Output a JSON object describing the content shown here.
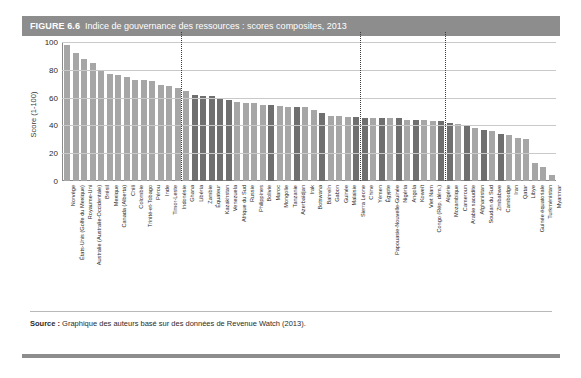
{
  "figure": {
    "number": "FIGURE 6.6",
    "title": "Indice de gouvernance des ressources : scores composites, 2013"
  },
  "source": {
    "label": "Source :",
    "text": "Graphique des auteurs basé sur des données de Revenue Watch (2013)."
  },
  "colors": {
    "header_band": "#8d8d8d",
    "bar_light": "#a6a6a6",
    "bar_dark": "#6f6f6f",
    "gridline": "#c9c9c9",
    "divider": "#3c3c3c"
  },
  "chart_data": {
    "type": "bar",
    "title": "Indice de gouvernance des ressources : scores composites, 2013",
    "xlabel": "",
    "ylabel": "Score (1-100)",
    "ylim": [
      0,
      100
    ],
    "yticks": [
      0,
      20,
      40,
      60,
      80,
      100
    ],
    "grid": true,
    "legend": "none",
    "dividers_after_index": [
      13,
      34,
      44
    ],
    "categories": [
      "Norvège",
      "États-Unis (Golfe du Mexique)",
      "Royaume-Uni",
      "Australie (Australie-Occidentale)",
      "Brésil",
      "Mexique",
      "Canada (Alberta)",
      "Chili",
      "Colombie",
      "Trinité-et-Tobago",
      "Pérou",
      "Inde",
      "Timor-Leste",
      "Indonésie",
      "Ghana",
      "Libéria",
      "Zambie",
      "Équateur",
      "Kazakhstan",
      "Venezuela",
      "Afrique du Sud",
      "Russie",
      "Philippines",
      "Bolivie",
      "Maroc",
      "Mongolie",
      "Tanzanie",
      "Azerbaïdjan",
      "Irak",
      "Botswana",
      "Bahreïn",
      "Gabon",
      "Guinée",
      "Malaisie",
      "Sierra Leone",
      "Chine",
      "Yémen",
      "Égypte",
      "Papouasie-Nouvelle-Guinée",
      "Nigéria",
      "Angola",
      "Koweït",
      "Viet Nam",
      "Congo (Rép. dém.)",
      "Algérie",
      "Mozambique",
      "Cameroun",
      "Arabie saoudite",
      "Afghanistan",
      "Soudan du Sud",
      "Zimbabwe",
      "Cambodge",
      "Iran",
      "Qatar",
      "Libye",
      "Guinée équatoriale",
      "Turkménistan",
      "Myanmar"
    ],
    "values": [
      98,
      92,
      88,
      85,
      80,
      77,
      76,
      75,
      73,
      73,
      72,
      69,
      68,
      67,
      65,
      62,
      61,
      61,
      60,
      58,
      57,
      56,
      56,
      55,
      55,
      54,
      53,
      53,
      53,
      51,
      49,
      47,
      47,
      46,
      46,
      45,
      45,
      45,
      45,
      45,
      44,
      44,
      44,
      43,
      43,
      42,
      41,
      40,
      38,
      37,
      36,
      34,
      33,
      31,
      30,
      13,
      10,
      4
    ],
    "bar_tones": [
      "light",
      "light",
      "light",
      "light",
      "light",
      "light",
      "light",
      "light",
      "light",
      "light",
      "light",
      "light",
      "light",
      "light",
      "light",
      "dark",
      "dark",
      "dark",
      "dark",
      "dark",
      "light",
      "light",
      "light",
      "light",
      "dark",
      "light",
      "light",
      "dark",
      "light",
      "light",
      "dark",
      "light",
      "light",
      "light",
      "dark",
      "dark",
      "light",
      "dark",
      "light",
      "dark",
      "light",
      "dark",
      "light",
      "light",
      "dark",
      "dark",
      "light",
      "dark",
      "light",
      "dark",
      "light",
      "dark",
      "light",
      "light",
      "light",
      "light",
      "light",
      "light"
    ]
  }
}
